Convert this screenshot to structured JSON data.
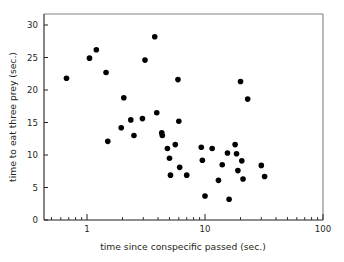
{
  "chart_data": {
    "type": "scatter",
    "title": "",
    "xlabel": "time since conspecific passed (sec.)",
    "ylabel": "time to eat three prey (sec.)",
    "xscale": "log",
    "yscale": "linear",
    "xlim": [
      0.4,
      130
    ],
    "ylim": [
      0,
      31.2
    ],
    "xticks": [
      1,
      10,
      100
    ],
    "xtick_labels": [
      "1",
      "10",
      "100"
    ],
    "yticks": [
      0,
      5,
      10,
      15,
      20,
      25,
      30
    ],
    "ytick_labels": [
      "0",
      "5",
      "10",
      "15",
      "20",
      "25",
      "30"
    ],
    "grid": false,
    "legend": false,
    "minor_ticks_x": true,
    "marker": "filled-circle",
    "marker_color": "#000000",
    "points": [
      {
        "x": 0.67,
        "y": 21.8
      },
      {
        "x": 1.05,
        "y": 24.9
      },
      {
        "x": 1.2,
        "y": 26.2
      },
      {
        "x": 1.45,
        "y": 22.7
      },
      {
        "x": 1.5,
        "y": 12.1
      },
      {
        "x": 1.95,
        "y": 14.2
      },
      {
        "x": 2.05,
        "y": 18.8
      },
      {
        "x": 2.35,
        "y": 15.4
      },
      {
        "x": 2.5,
        "y": 13.0
      },
      {
        "x": 2.95,
        "y": 15.6
      },
      {
        "x": 3.1,
        "y": 24.6
      },
      {
        "x": 3.75,
        "y": 28.2
      },
      {
        "x": 3.9,
        "y": 16.5
      },
      {
        "x": 4.3,
        "y": 13.4
      },
      {
        "x": 4.35,
        "y": 13.0
      },
      {
        "x": 4.8,
        "y": 11.0
      },
      {
        "x": 5.0,
        "y": 9.5
      },
      {
        "x": 5.1,
        "y": 6.9
      },
      {
        "x": 5.6,
        "y": 11.6
      },
      {
        "x": 5.9,
        "y": 21.6
      },
      {
        "x": 6.0,
        "y": 15.2
      },
      {
        "x": 6.1,
        "y": 8.1
      },
      {
        "x": 7.0,
        "y": 6.9
      },
      {
        "x": 9.3,
        "y": 11.2
      },
      {
        "x": 9.5,
        "y": 9.2
      },
      {
        "x": 10.0,
        "y": 3.7
      },
      {
        "x": 11.5,
        "y": 11.0
      },
      {
        "x": 13.0,
        "y": 6.1
      },
      {
        "x": 14.0,
        "y": 8.5
      },
      {
        "x": 15.5,
        "y": 10.3
      },
      {
        "x": 16.0,
        "y": 3.2
      },
      {
        "x": 18.0,
        "y": 11.6
      },
      {
        "x": 18.5,
        "y": 10.2
      },
      {
        "x": 19.0,
        "y": 7.6
      },
      {
        "x": 20.0,
        "y": 21.3
      },
      {
        "x": 20.5,
        "y": 9.1
      },
      {
        "x": 21.0,
        "y": 6.3
      },
      {
        "x": 23.0,
        "y": 18.6
      },
      {
        "x": 30.0,
        "y": 8.4
      },
      {
        "x": 32.0,
        "y": 6.7
      }
    ]
  }
}
